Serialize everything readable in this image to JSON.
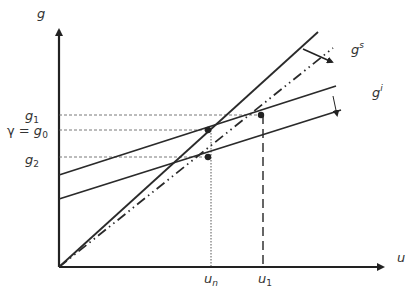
{
  "diagram": {
    "axes": {
      "y_label": "g",
      "x_label": "u"
    },
    "y_ticks": [
      {
        "label": "g",
        "sub": "1",
        "prefix": ""
      },
      {
        "label": "g",
        "sub": "0",
        "prefix": "γ = "
      },
      {
        "label": "g",
        "sub": "2",
        "prefix": ""
      }
    ],
    "x_ticks": [
      {
        "label": "u",
        "sub": "n"
      },
      {
        "label": "u",
        "sub": "1"
      }
    ],
    "curves": {
      "gs_label": "g",
      "gs_sup": "s",
      "gi_label": "g",
      "gi_sup": "i"
    },
    "colors": {
      "line": "#2a2a2a",
      "guide": "#555555",
      "text": "#333333"
    }
  }
}
